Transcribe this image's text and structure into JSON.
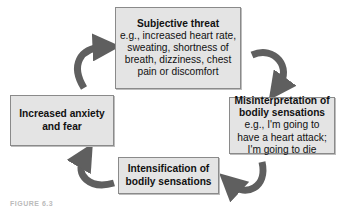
{
  "diagram": {
    "type": "cycle",
    "nodes": [
      {
        "id": "subjective-threat",
        "title": "Subjective threat",
        "detail": "e.g., increased heart rate, sweating, shortness of breath, dizziness, chest pain or discomfort"
      },
      {
        "id": "misinterpretation",
        "title": "Misinterpretation of bodily sensations",
        "detail": "e.g., I'm going to have a heart attack; I'm going to die"
      },
      {
        "id": "intensification",
        "title": "Intensification of bodily sensations",
        "detail": ""
      },
      {
        "id": "increased-anxiety",
        "title": "Increased anxiety and fear",
        "detail": ""
      }
    ],
    "edges": [
      {
        "from": "subjective-threat",
        "to": "misinterpretation"
      },
      {
        "from": "misinterpretation",
        "to": "intensification"
      },
      {
        "from": "intensification",
        "to": "increased-anxiety"
      },
      {
        "from": "increased-anxiety",
        "to": "subjective-threat"
      }
    ],
    "colors": {
      "box_fill": "#e4e4e4",
      "box_border": "#8a8a8a",
      "arrow": "#5f5f5f"
    },
    "caption": "FIGURE 6.3"
  }
}
